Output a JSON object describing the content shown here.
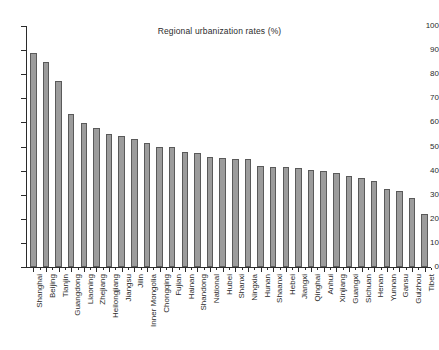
{
  "chart_data": {
    "type": "bar",
    "title": "Regional urbanization rates (%)",
    "xlabel": "",
    "ylabel": "",
    "ylim": [
      0,
      100
    ],
    "ytick_step": 10,
    "yticks": [
      0,
      10,
      20,
      30,
      40,
      50,
      60,
      70,
      80,
      90,
      100
    ],
    "grid": false,
    "legend": null,
    "legend_position": "none",
    "orientation": "vertical",
    "bar_color": "#9c9c9c",
    "bar_edge_color": "#5a5a5a",
    "axis_color": "#2b2b2b",
    "background": "#ffffff",
    "xtick_label_rotation": -90,
    "categories": [
      "Shanghai",
      "Beijing",
      "Tianjin",
      "Guangdong",
      "Liaoning",
      "Zhejiang",
      "Heilongjiang",
      "Jiangsu",
      "Jilin",
      "Inner Mongolia",
      "Chongqing",
      "Fujian",
      "Hainan",
      "Shandong",
      "National",
      "Hubei",
      "Shanxi",
      "Ningxia",
      "Hunan",
      "Shaanxi",
      "Hebei",
      "Jiangxi",
      "Qinghai",
      "Anhui",
      "Xinjiang",
      "Guangxi",
      "Sichuan",
      "Henan",
      "Yunnan",
      "Gansu",
      "Guizhou",
      "Tibet"
    ],
    "values": [
      88.6,
      85.0,
      77.3,
      63.4,
      59.9,
      57.6,
      55.4,
      54.3,
      53.0,
      51.3,
      49.7,
      49.7,
      47.8,
      47.4,
      45.7,
      45.2,
      44.9,
      44.8,
      42.1,
      41.6,
      41.6,
      41.1,
      40.4,
      40.0,
      39.2,
      37.6,
      36.8,
      35.7,
      32.5,
      31.7,
      28.8,
      22.0
    ],
    "value_unit": "%",
    "series_name": "Urbanization rate"
  }
}
